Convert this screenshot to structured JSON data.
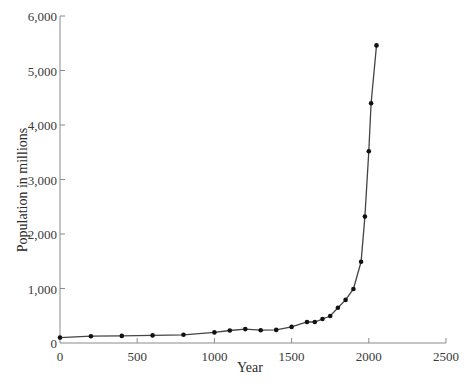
{
  "chart_data": {
    "type": "line",
    "title": "",
    "xlabel": "Year",
    "ylabel": "Population in millions",
    "xlim": [
      0,
      2500
    ],
    "ylim": [
      0,
      6000
    ],
    "grid": false,
    "legend": null,
    "x_ticks": [
      0,
      500,
      1000,
      1500,
      2000,
      2500
    ],
    "x_tick_labels": [
      "0",
      "500",
      "1000",
      "1500",
      "2000",
      "2500"
    ],
    "y_ticks": [
      0,
      1000,
      2000,
      3000,
      4000,
      5000,
      6000
    ],
    "y_tick_labels": [
      "0",
      "1,000",
      "2,000",
      "3,000",
      "4,000",
      "5,000",
      "6,000"
    ],
    "series": [
      {
        "name": "World population",
        "marker": "circle",
        "color": "#111111",
        "x": [
          0,
          200,
          400,
          600,
          800,
          1000,
          1100,
          1200,
          1300,
          1400,
          1500,
          1600,
          1650,
          1700,
          1750,
          1800,
          1850,
          1900,
          1950,
          1975,
          2000,
          2015,
          2050
        ],
        "values": [
          100,
          125,
          130,
          140,
          150,
          195,
          230,
          255,
          235,
          240,
          295,
          385,
          385,
          440,
          495,
          645,
          790,
          990,
          1490,
          2320,
          3520,
          4400,
          5460
        ]
      }
    ]
  },
  "labels": {
    "x_title": "Year",
    "y_title": "Population in millions",
    "y_zero": "0"
  }
}
